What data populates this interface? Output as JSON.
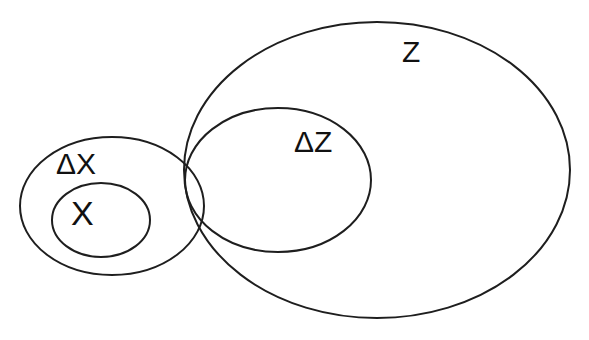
{
  "diagram": {
    "type": "set-inclusion-diagram",
    "stroke_color": "#1e1e1e",
    "background_color": "#ffffff",
    "sets": [
      {
        "id": "Z",
        "label": "Z",
        "cx": 377,
        "cy": 170,
        "rx": 193,
        "ry": 148,
        "label_x": 402,
        "label_y": 62,
        "font_size": 30
      },
      {
        "id": "dZ",
        "label": "ΔZ",
        "cx": 278,
        "cy": 180,
        "rx": 93,
        "ry": 72,
        "label_x": 294,
        "label_y": 152,
        "font_size": 30
      },
      {
        "id": "dX",
        "label": "ΔX",
        "cx": 112,
        "cy": 206,
        "rx": 92,
        "ry": 69,
        "label_x": 56,
        "label_y": 174,
        "font_size": 30
      },
      {
        "id": "X",
        "label": "X",
        "cx": 101,
        "cy": 220,
        "rx": 49,
        "ry": 37,
        "label_x": 71,
        "label_y": 225,
        "font_size": 34
      }
    ],
    "relations": [
      {
        "subset": "X",
        "superset": "ΔX"
      },
      {
        "subset": "ΔZ",
        "superset": "Z"
      },
      {
        "overlap": [
          "ΔX",
          "ΔZ",
          "Z"
        ]
      }
    ]
  }
}
